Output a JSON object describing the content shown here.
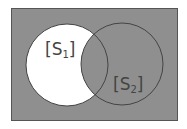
{
  "diagram": {
    "type": "venn",
    "universe": {
      "x": 11,
      "y": 8,
      "width": 166,
      "height": 112,
      "fill": "#8f8f8f",
      "stroke": "#555555"
    },
    "sets": [
      {
        "id": "S1",
        "label_open": "[",
        "label_main": "S",
        "label_sub": "1",
        "label_close": "]",
        "cx": 67,
        "cy": 65,
        "r": 41
      },
      {
        "id": "S2",
        "label_open": "[",
        "label_main": "S",
        "label_sub": "2",
        "label_close": "]",
        "cx": 122,
        "cy": 64,
        "r": 41
      }
    ],
    "highlighted_region": "S1 minus S2",
    "colors": {
      "background": "#8f8f8f",
      "highlight": "#ffffff",
      "stroke": "#444444",
      "text": "#444444"
    }
  }
}
